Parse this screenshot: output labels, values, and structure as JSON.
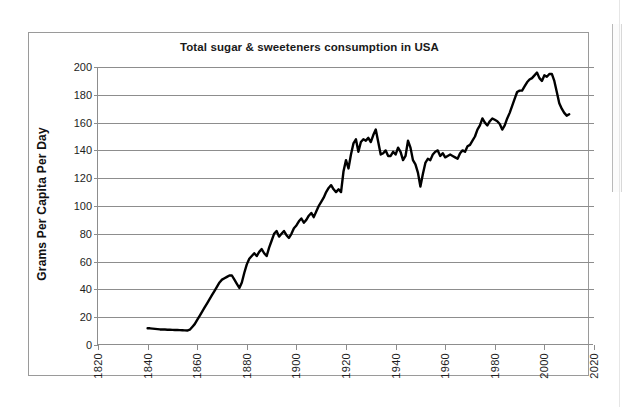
{
  "chart_data": {
    "type": "line",
    "title": "Total sugar & sweeteners consumption in USA",
    "xlabel": "",
    "ylabel": "Grams Per Capita Per Day",
    "xlim": [
      1820,
      2020
    ],
    "ylim": [
      0,
      200
    ],
    "grid": true,
    "legend": "none",
    "line_color": "#000000",
    "x_tick_labels": [
      "1820",
      "1840",
      "1860",
      "1880",
      "1900",
      "1920",
      "1940",
      "1960",
      "1980",
      "2000",
      "2020"
    ],
    "x_ticks": [
      1820,
      1840,
      1860,
      1880,
      1900,
      1920,
      1940,
      1960,
      1980,
      2000,
      2020
    ],
    "y_tick_labels": [
      "0",
      "20",
      "40",
      "60",
      "80",
      "100",
      "120",
      "140",
      "160",
      "180",
      "200"
    ],
    "y_ticks": [
      0,
      20,
      40,
      60,
      80,
      100,
      120,
      140,
      160,
      180,
      200
    ],
    "series": [
      {
        "name": "Total sugar & sweeteners consumption",
        "x": [
          1840,
          1841,
          1842,
          1843,
          1844,
          1845,
          1846,
          1847,
          1848,
          1849,
          1850,
          1851,
          1852,
          1853,
          1854,
          1855,
          1856,
          1857,
          1858,
          1859,
          1860,
          1861,
          1862,
          1863,
          1864,
          1865,
          1866,
          1867,
          1868,
          1869,
          1870,
          1871,
          1872,
          1873,
          1874,
          1875,
          1876,
          1877,
          1878,
          1879,
          1880,
          1881,
          1882,
          1883,
          1884,
          1885,
          1886,
          1887,
          1888,
          1889,
          1890,
          1891,
          1892,
          1893,
          1894,
          1895,
          1896,
          1897,
          1898,
          1899,
          1900,
          1901,
          1902,
          1903,
          1904,
          1905,
          1906,
          1907,
          1908,
          1909,
          1910,
          1911,
          1912,
          1913,
          1914,
          1915,
          1916,
          1917,
          1918,
          1919,
          1920,
          1921,
          1922,
          1923,
          1924,
          1925,
          1926,
          1927,
          1928,
          1929,
          1930,
          1931,
          1932,
          1933,
          1934,
          1935,
          1936,
          1937,
          1938,
          1939,
          1940,
          1941,
          1942,
          1943,
          1944,
          1945,
          1946,
          1947,
          1948,
          1949,
          1950,
          1951,
          1952,
          1953,
          1954,
          1955,
          1956,
          1957,
          1958,
          1959,
          1960,
          1961,
          1962,
          1963,
          1964,
          1965,
          1966,
          1967,
          1968,
          1969,
          1970,
          1971,
          1972,
          1973,
          1974,
          1975,
          1976,
          1977,
          1978,
          1979,
          1980,
          1981,
          1982,
          1983,
          1984,
          1985,
          1986,
          1987,
          1988,
          1989,
          1990,
          1991,
          1992,
          1993,
          1994,
          1995,
          1996,
          1997,
          1998,
          1999,
          2000,
          2001,
          2002,
          2003,
          2004,
          2005,
          2006,
          2007,
          2008,
          2009,
          2010
        ],
        "values": [
          12,
          12,
          11.8,
          11.6,
          11.4,
          11.2,
          11.2,
          11.1,
          11,
          11,
          10.9,
          10.8,
          10.8,
          10.7,
          10.6,
          10.5,
          10.4,
          11,
          13,
          15,
          18,
          21,
          24,
          27,
          30,
          33,
          36,
          39,
          42,
          45,
          47,
          48,
          49,
          50,
          50,
          47,
          44,
          41,
          45,
          52,
          58,
          62,
          64,
          66,
          64,
          67,
          69,
          66,
          64,
          70,
          75,
          80,
          82,
          78,
          80,
          82,
          79,
          77,
          80,
          84,
          86,
          89,
          91,
          88,
          90,
          93,
          95,
          92,
          96,
          100,
          103,
          106,
          110,
          113,
          115,
          112,
          110,
          112,
          110,
          125,
          133,
          127,
          137,
          145,
          148,
          139,
          146,
          148,
          147,
          149,
          146,
          151,
          155,
          146,
          137,
          138,
          140,
          136,
          136,
          139,
          137,
          142,
          139,
          133,
          136,
          147,
          142,
          133,
          130,
          124,
          114,
          123,
          131,
          134,
          133,
          137,
          139,
          140,
          136,
          138,
          135,
          136,
          137,
          136,
          135,
          134,
          138,
          140,
          139,
          143,
          144,
          147,
          150,
          155,
          158,
          163,
          160,
          158,
          161,
          163,
          162,
          161,
          159,
          155,
          158,
          163,
          167,
          172,
          177,
          182,
          183,
          183,
          186,
          189,
          191,
          192,
          194,
          196,
          192,
          190,
          194,
          193,
          195,
          195,
          190,
          182,
          174,
          170,
          167,
          165,
          166
        ],
        "units": "grams per capita per day"
      }
    ],
    "notes": {
      "start_year": 1840,
      "end_year": 2010,
      "peak_value": 196,
      "peak_year": 1997,
      "min_value": 10.4,
      "min_year": 1856,
      "wwii_low_value": 114,
      "wwii_low_year": 1950
    }
  },
  "figure": {
    "frame_border_color": "#9a9a9a",
    "axis_color": "#8d8d8d",
    "background": "#ffffff"
  }
}
